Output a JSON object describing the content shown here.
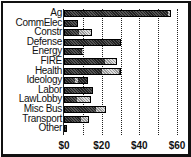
{
  "chart_data": {
    "type": "bar",
    "orientation": "horizontal",
    "stacked": true,
    "title": "",
    "xlabel": "",
    "ylabel": "",
    "categories": [
      "Ag",
      "CommElec",
      "Constr",
      "Defense",
      "Energy",
      "FIRE",
      "Health",
      "Ideology",
      "Labor",
      "LawLobby",
      "Misc Bus",
      "Transport",
      "Other"
    ],
    "series": [
      {
        "name": "dark",
        "values": [
          55,
          7.5,
          8,
          30,
          9.5,
          22,
          20,
          6,
          15.5,
          7,
          17,
          9,
          1.5
        ]
      },
      {
        "name": "light",
        "values": [
          2,
          0,
          7,
          0,
          0.5,
          6,
          10,
          2,
          0,
          7.5,
          5.5,
          4.5,
          0
        ]
      }
    ],
    "totals": [
      57,
      7.5,
      15,
      30,
      10,
      28,
      30,
      12.5,
      15.5,
      14.5,
      22.5,
      13.5,
      1.5
    ],
    "light_segment_ranges": [
      [
        55,
        57
      ],
      null,
      [
        8,
        15
      ],
      null,
      [
        9.5,
        10
      ],
      [
        22,
        28
      ],
      [
        20,
        30
      ],
      [
        6,
        8
      ],
      null,
      [
        7,
        14.5
      ],
      [
        17,
        22.5
      ],
      [
        9,
        13.5
      ],
      null
    ],
    "xlim": [
      0,
      60
    ],
    "xticks": [
      "$0",
      "$20",
      "$40",
      "$60"
    ],
    "grid": true,
    "grid_interval": 10,
    "legend": null
  },
  "ticks": [
    "$0",
    "$20",
    "$40",
    "$60"
  ]
}
